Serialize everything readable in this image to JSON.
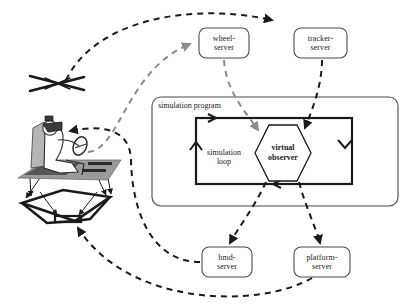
{
  "diagram": {
    "title_text": "",
    "colors": {
      "stroke": "#1a1a1a",
      "gray_dash": "#8c8c8c",
      "platform_fill": "#9a9a9a",
      "seat_fill": "#b5b5b5",
      "body_fill": "#ffffff",
      "background": "#ffffff"
    },
    "servers": [
      {
        "id": "wheel-server",
        "line1": "wheel-",
        "line2": "server",
        "x": 199,
        "y": 28,
        "w": 50,
        "h": 30
      },
      {
        "id": "tracker-server",
        "line1": "tracker-",
        "line2": "server",
        "x": 294,
        "y": 28,
        "w": 53,
        "h": 30
      },
      {
        "id": "hmd-server",
        "line1": "hmd-",
        "line2": "server",
        "x": 202,
        "y": 247,
        "w": 50,
        "h": 30
      },
      {
        "id": "platform-server",
        "line1": "platform-",
        "line2": "server",
        "x": 294,
        "y": 247,
        "w": 56,
        "h": 30
      }
    ],
    "program": {
      "label": "simulation program",
      "label_x": 158,
      "label_y": 101,
      "box": {
        "x": 152,
        "y": 97,
        "w": 246,
        "h": 109,
        "r": 9
      }
    },
    "loop": {
      "label_line1": "simulation",
      "label_line2": "loop",
      "label_x": 199,
      "label_y": 152,
      "rect": {
        "x": 196,
        "y": 118,
        "w": 156,
        "h": 66
      }
    },
    "observer": {
      "line1": "virtual",
      "line2": "observer",
      "cx": 283,
      "cy": 153,
      "rx": 28,
      "ry": 29
    },
    "actor": {
      "name": "vr-driver-on-motion-platform",
      "headset": "hmd",
      "control": "steering-wheel",
      "base": "motion-platform"
    },
    "tracker_marker": {
      "name": "optical-tracker-cross",
      "cx": 57,
      "cy": 84
    },
    "flows": [
      {
        "id": "tracker-to-trackerserver",
        "from": "optical-tracker-cross",
        "to": "tracker-server",
        "style": "dashed-black"
      },
      {
        "id": "wheel-to-wheelserver",
        "from": "steering-wheel",
        "to": "wheel-server",
        "style": "dashed-gray"
      },
      {
        "id": "wheelserver-to-observer",
        "from": "wheel-server",
        "to": "virtual-observer",
        "style": "dashed-gray"
      },
      {
        "id": "trackerserver-to-observer",
        "from": "tracker-server",
        "to": "virtual-observer",
        "style": "dashed-black"
      },
      {
        "id": "observer-to-hmdserver",
        "from": "virtual-observer",
        "to": "hmd-server",
        "style": "dashed-black"
      },
      {
        "id": "observer-to-platserver",
        "from": "virtual-observer",
        "to": "platform-server",
        "style": "dashed-black"
      },
      {
        "id": "hmdserver-to-hmd",
        "from": "hmd-server",
        "to": "hmd",
        "style": "dashed-black"
      },
      {
        "id": "platserver-to-platform",
        "from": "platform-server",
        "to": "motion-platform",
        "style": "dashed-black"
      }
    ]
  }
}
